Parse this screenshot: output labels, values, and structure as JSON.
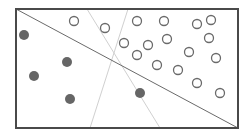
{
  "diagram": {
    "title": "",
    "frame": {
      "x1": 16,
      "y1": 9,
      "x2": 238,
      "y2": 128,
      "stroke": "#4a4a4a"
    },
    "lines": [
      {
        "name": "dark-separator-line",
        "x1": 16,
        "y1": 9,
        "x2": 238,
        "y2": 128,
        "stroke": "#6a6a6a",
        "width": 1
      },
      {
        "name": "light-separator-line-a",
        "x1": 87,
        "y1": 9,
        "x2": 160,
        "y2": 128,
        "stroke": "#d0d0d0",
        "width": 1
      },
      {
        "name": "light-separator-line-b",
        "x1": 128,
        "y1": 9,
        "x2": 90,
        "y2": 128,
        "stroke": "#d0d0d0",
        "width": 1
      }
    ],
    "filled_points": {
      "color": "#666666",
      "radius": 5,
      "points": [
        [
          24,
          35
        ],
        [
          67,
          62
        ],
        [
          34,
          76
        ],
        [
          70,
          99
        ],
        [
          140,
          93
        ]
      ]
    },
    "open_points": {
      "stroke": "#6a6a6a",
      "radius": 4.5,
      "points": [
        [
          74,
          21
        ],
        [
          105,
          28
        ],
        [
          137,
          21
        ],
        [
          164,
          21
        ],
        [
          197,
          24
        ],
        [
          211,
          20
        ],
        [
          124,
          43
        ],
        [
          148,
          45
        ],
        [
          167,
          39
        ],
        [
          209,
          38
        ],
        [
          137,
          55
        ],
        [
          157,
          65
        ],
        [
          178,
          70
        ],
        [
          189,
          52
        ],
        [
          216,
          58
        ],
        [
          197,
          83
        ],
        [
          220,
          93
        ]
      ]
    }
  }
}
